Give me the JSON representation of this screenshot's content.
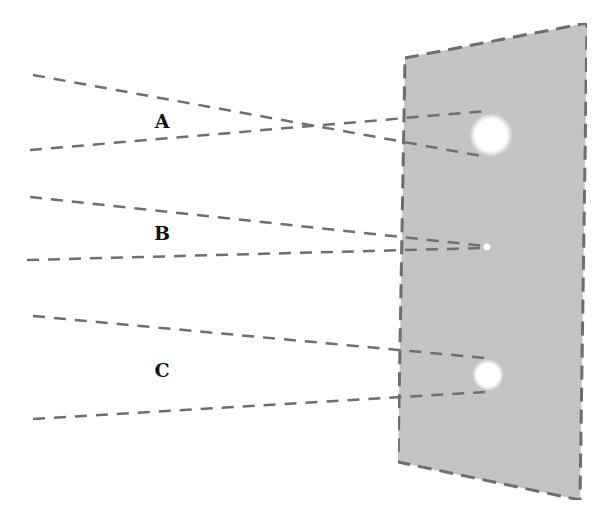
{
  "diagram": {
    "colors": {
      "background": "#ffffff",
      "screen_fill": "#c4c4c4",
      "screen_border": "#666666",
      "ray": "#6e6e6e",
      "spot": "#ffffff",
      "label": "#111111"
    },
    "screen": {
      "corners": [
        [
          405,
          58
        ],
        [
          587,
          23
        ],
        [
          580,
          500
        ],
        [
          398,
          462
        ]
      ]
    },
    "groups": [
      {
        "label": "A",
        "label_pos": [
          162,
          121
        ],
        "rays": [
          {
            "from": [
              33,
              75
            ],
            "to": [
              487,
              157
            ]
          },
          {
            "from": [
              30,
              150
            ],
            "to": [
              487,
              111
            ]
          }
        ],
        "spot": {
          "cx": 491,
          "cy": 135,
          "r": 22
        }
      },
      {
        "label": "B",
        "label_pos": [
          162,
          233
        ],
        "rays": [
          {
            "from": [
              30,
              197
            ],
            "to": [
              484,
              246
            ]
          },
          {
            "from": [
              27,
              260
            ],
            "to": [
              484,
              248
            ]
          }
        ],
        "spot": {
          "cx": 487,
          "cy": 247,
          "r": 4
        }
      },
      {
        "label": "C",
        "label_pos": [
          162,
          370
        ],
        "rays": [
          {
            "from": [
              33,
              316
            ],
            "to": [
              485,
              358
            ]
          },
          {
            "from": [
              33,
              419
            ],
            "to": [
              485,
              392
            ]
          }
        ],
        "spot": {
          "cx": 488,
          "cy": 375,
          "r": 16
        }
      }
    ]
  }
}
